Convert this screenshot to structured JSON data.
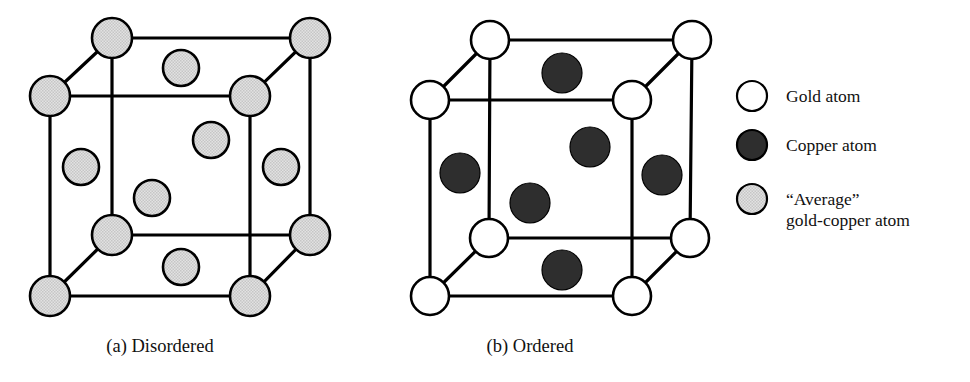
{
  "figure": {
    "background_color": "#ffffff"
  },
  "colors": {
    "gold_atom": "#ffffff",
    "copper_atom": "#2e2e2e",
    "average_atom": "#d9d9d9",
    "edge": "#000000",
    "text": "#111111"
  },
  "panels": [
    {
      "id": "panel-a",
      "caption": "(a) Disordered",
      "caption_x": 160,
      "caption_y": 352,
      "atom_style": "average",
      "atom_radius_corner": 20,
      "atom_radius_face": 18,
      "cube": {
        "front_bottom_left": [
          50,
          296
        ],
        "front_bottom_right": [
          250,
          296
        ],
        "front_top_left": [
          50,
          96
        ],
        "front_top_right": [
          250,
          96
        ],
        "back_bottom_left": [
          112,
          235
        ],
        "back_bottom_right": [
          310,
          235
        ],
        "back_top_left": [
          112,
          38
        ],
        "back_top_right": [
          310,
          38
        ]
      },
      "corner_atoms": [
        {
          "name": "back-top-left",
          "cx": 112,
          "cy": 38
        },
        {
          "name": "back-top-right",
          "cx": 310,
          "cy": 38
        },
        {
          "name": "front-top-left",
          "cx": 50,
          "cy": 96
        },
        {
          "name": "front-top-right",
          "cx": 250,
          "cy": 96
        },
        {
          "name": "back-bottom-left",
          "cx": 112,
          "cy": 235
        },
        {
          "name": "back-bottom-right",
          "cx": 310,
          "cy": 235
        },
        {
          "name": "front-bottom-left",
          "cx": 50,
          "cy": 296
        },
        {
          "name": "front-bottom-right",
          "cx": 250,
          "cy": 296
        }
      ],
      "face_atoms": [
        {
          "name": "top-face",
          "cx": 181,
          "cy": 68
        },
        {
          "name": "back-face",
          "cx": 211,
          "cy": 140
        },
        {
          "name": "left-face",
          "cx": 81,
          "cy": 167
        },
        {
          "name": "right-face",
          "cx": 281,
          "cy": 167
        },
        {
          "name": "front-face",
          "cx": 152,
          "cy": 198
        },
        {
          "name": "bottom-face",
          "cx": 181,
          "cy": 267
        }
      ]
    },
    {
      "id": "panel-b",
      "caption": "(b) Ordered",
      "caption_x": 530,
      "caption_y": 352,
      "atom_style": "gold",
      "atom_radius_corner": 19,
      "atom_radius_face": 20,
      "cube": {
        "front_bottom_left": [
          430,
          296
        ],
        "front_bottom_right": [
          632,
          296
        ],
        "front_top_left": [
          430,
          100
        ],
        "front_top_right": [
          632,
          100
        ],
        "back_bottom_left": [
          489,
          238
        ],
        "back_bottom_right": [
          690,
          238
        ],
        "back_top_left": [
          490,
          40
        ],
        "back_top_right": [
          692,
          40
        ]
      },
      "corner_atoms": [
        {
          "name": "back-top-left",
          "cx": 490,
          "cy": 40
        },
        {
          "name": "back-top-right",
          "cx": 692,
          "cy": 40
        },
        {
          "name": "front-top-left",
          "cx": 430,
          "cy": 100
        },
        {
          "name": "front-top-right",
          "cx": 632,
          "cy": 100
        },
        {
          "name": "back-bottom-left",
          "cx": 489,
          "cy": 238
        },
        {
          "name": "back-bottom-right",
          "cx": 690,
          "cy": 238
        },
        {
          "name": "front-bottom-left",
          "cx": 430,
          "cy": 296
        },
        {
          "name": "front-bottom-right",
          "cx": 632,
          "cy": 296
        }
      ],
      "face_atoms": [
        {
          "name": "top-face",
          "cx": 562,
          "cy": 73
        },
        {
          "name": "back-face",
          "cx": 590,
          "cy": 147
        },
        {
          "name": "left-face",
          "cx": 460,
          "cy": 173
        },
        {
          "name": "right-face",
          "cx": 662,
          "cy": 175
        },
        {
          "name": "front-face",
          "cx": 530,
          "cy": 203
        },
        {
          "name": "bottom-face",
          "cx": 562,
          "cy": 270
        }
      ]
    }
  ],
  "legend": {
    "swatch_x": 752,
    "text_x": 786,
    "items": [
      {
        "id": "gold",
        "style": "white",
        "cy": 96,
        "radius": 15,
        "lines": [
          "Gold atom"
        ]
      },
      {
        "id": "copper",
        "style": "dark",
        "cy": 145,
        "radius": 15,
        "lines": [
          "Copper atom"
        ]
      },
      {
        "id": "average",
        "style": "gray",
        "cy": 199,
        "radius": 15,
        "lines": [
          "“Average”",
          "gold-copper atom"
        ]
      }
    ]
  }
}
